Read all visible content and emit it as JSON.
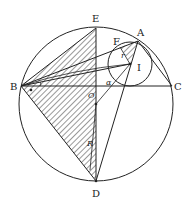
{
  "diagram": {
    "points": {
      "A": "A",
      "B": "B",
      "C": "C",
      "D": "D",
      "E": "E",
      "F": "F",
      "I": "I",
      "O": "O"
    },
    "symbols": {
      "alpha": "α",
      "R": "R",
      "r": "r"
    },
    "colors": {
      "stroke": "#222222",
      "background": "#ffffff",
      "hatch": "#333333"
    }
  }
}
